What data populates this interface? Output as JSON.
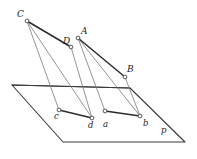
{
  "figure": {
    "canvas": {
      "width": 197,
      "height": 159,
      "background": "#ffffff"
    },
    "colors": {
      "stroke_thick": "#2b2b2b",
      "stroke_plane": "#3a3a3a",
      "stroke_thin": "#7a7a7a",
      "vertex_fill": "#ffffff",
      "vertex_stroke": "#4a4a4a",
      "label_text": "#1d1d1d"
    },
    "points": [
      {
        "id": "C",
        "label": "C",
        "x": 27,
        "y": 21,
        "label_x": 17,
        "label_y": 10,
        "kind": "upper-vertex"
      },
      {
        "id": "A",
        "label": "A",
        "x": 78,
        "y": 38,
        "label_x": 81,
        "label_y": 27,
        "kind": "upper-vertex"
      },
      {
        "id": "D",
        "label": "D",
        "x": 71,
        "y": 47,
        "label_x": 63,
        "label_y": 37,
        "kind": "upper-vertex"
      },
      {
        "id": "B",
        "label": "B",
        "x": 125,
        "y": 77,
        "label_x": 127,
        "label_y": 65,
        "kind": "upper-vertex"
      },
      {
        "id": "c",
        "label": "c",
        "x": 59,
        "y": 110,
        "label_x": 54,
        "label_y": 112,
        "kind": "projected-vertex"
      },
      {
        "id": "d",
        "label": "d",
        "x": 92,
        "y": 118,
        "label_x": 88,
        "label_y": 121,
        "kind": "projected-vertex"
      },
      {
        "id": "a",
        "label": "a",
        "x": 105,
        "y": 111,
        "label_x": 103,
        "label_y": 120,
        "kind": "projected-vertex"
      },
      {
        "id": "b",
        "label": "b",
        "x": 140,
        "y": 116,
        "label_x": 143,
        "label_y": 119,
        "kind": "projected-vertex"
      },
      {
        "id": "p",
        "label": "p",
        "x": 165,
        "y": 133,
        "label_x": 161,
        "label_y": 126,
        "kind": "plane-name"
      }
    ],
    "plane": {
      "name": "p",
      "outline": "12,85 130,88 185,142 63,142",
      "top_edge": {
        "x1": 12,
        "y1": 85,
        "x2": 130,
        "y2": 88
      }
    },
    "edges_thick": [
      {
        "from": "C",
        "to": "D",
        "x1": 27,
        "y1": 21,
        "x2": 71,
        "y2": 47
      },
      {
        "from": "A",
        "to": "B",
        "x1": 78,
        "y1": 38,
        "x2": 125,
        "y2": 77
      },
      {
        "from": "c",
        "to": "d",
        "x1": 59,
        "y1": 110,
        "x2": 92,
        "y2": 118
      },
      {
        "from": "a",
        "to": "b",
        "x1": 105,
        "y1": 111,
        "x2": 140,
        "y2": 116
      }
    ],
    "edges_thin": [
      {
        "from": "C",
        "to": "c",
        "x1": 27,
        "y1": 21,
        "x2": 59,
        "y2": 110
      },
      {
        "from": "C",
        "to": "d",
        "x1": 27,
        "y1": 21,
        "x2": 92,
        "y2": 118
      },
      {
        "from": "D",
        "to": "d",
        "x1": 71,
        "y1": 47,
        "x2": 92,
        "y2": 118
      },
      {
        "from": "A",
        "to": "a",
        "x1": 78,
        "y1": 38,
        "x2": 105,
        "y2": 111
      },
      {
        "from": "A",
        "to": "b",
        "x1": 78,
        "y1": 38,
        "x2": 140,
        "y2": 116
      },
      {
        "from": "B",
        "to": "b",
        "x1": 125,
        "y1": 77,
        "x2": 140,
        "y2": 116
      }
    ]
  }
}
